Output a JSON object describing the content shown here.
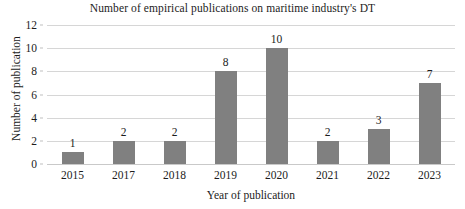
{
  "chart_data": {
    "type": "bar",
    "title": "Number of empirical publications on maritime industry's DT",
    "xlabel": "Year of publication",
    "ylabel": "Number of publication",
    "categories": [
      "2015",
      "2017",
      "2018",
      "2019",
      "2020",
      "2021",
      "2022",
      "2023"
    ],
    "values": [
      1,
      2,
      2,
      8,
      10,
      2,
      3,
      7
    ],
    "value_labels": [
      "1",
      "2",
      "2",
      "8",
      "10",
      "2",
      "3",
      "7"
    ],
    "ylim": [
      0,
      12
    ],
    "yticks": [
      0,
      2,
      4,
      6,
      8,
      10,
      12
    ],
    "ytick_labels": [
      "0",
      "2",
      "4",
      "6",
      "8",
      "10",
      "12"
    ],
    "grid": "horizontal",
    "legend": "none",
    "bar_color": "#808080",
    "gridline_color": "#d6d6d6",
    "text_color": "#1c1c1c",
    "background_color": "#ffffff",
    "data_labels_shown": true
  }
}
